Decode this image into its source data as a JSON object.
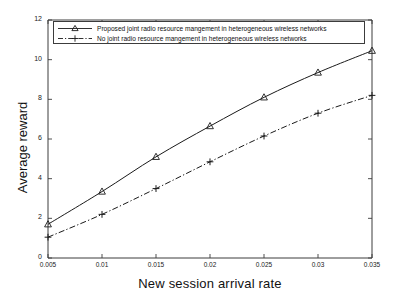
{
  "chart_data": {
    "type": "line",
    "title": "",
    "xlabel": "New session arrival rate",
    "ylabel": "Average reward",
    "x": [
      0.005,
      0.01,
      0.015,
      0.02,
      0.025,
      0.03,
      0.035
    ],
    "xticklabels": [
      "0.005",
      "0.01",
      "0.015",
      "0.02",
      "0.025",
      "0.03",
      "0.035"
    ],
    "yticks": [
      0,
      2,
      4,
      6,
      8,
      10,
      12
    ],
    "yticklabels": [
      "0",
      "2",
      "4",
      "6",
      "8",
      "10",
      "12"
    ],
    "xlim": [
      0.005,
      0.035
    ],
    "ylim": [
      0,
      12
    ],
    "grid": false,
    "legend_position": "top-left-inside",
    "series": [
      {
        "name": "Proposed joint radio resource mangement in heterogeneous wireless networks",
        "values": [
          1.7,
          3.35,
          5.1,
          6.65,
          8.1,
          9.35,
          10.45
        ],
        "marker": "triangle",
        "linestyle": "solid",
        "color": "#1a1a1a"
      },
      {
        "name": "No joint radio resource mangement in heterogeneous wireless networks",
        "values": [
          1.05,
          2.2,
          3.5,
          4.85,
          6.15,
          7.3,
          8.2
        ],
        "marker": "plus",
        "linestyle": "dash-dot",
        "color": "#1a1a1a"
      }
    ]
  },
  "legend": {
    "items": [
      {
        "label": "Proposed joint radio resource mangement in heterogeneous wireless networks"
      },
      {
        "label": "No joint radio resource mangement in heterogeneous wireless networks"
      }
    ]
  },
  "axes": {
    "x_label": "New session arrival rate",
    "y_label": "Average reward"
  }
}
